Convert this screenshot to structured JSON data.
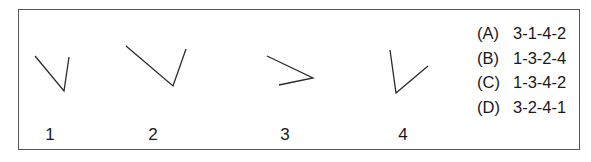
{
  "figures": [
    {
      "label": "1",
      "points": [
        [
          35,
          56
        ],
        [
          64,
          91
        ],
        [
          69,
          57
        ]
      ],
      "label_x": 50
    },
    {
      "label": "2",
      "points": [
        [
          126,
          46
        ],
        [
          173,
          86
        ],
        [
          186,
          49
        ]
      ],
      "label_x": 153
    },
    {
      "label": "3",
      "points": [
        [
          267,
          56
        ],
        [
          313,
          78
        ],
        [
          279,
          85
        ]
      ],
      "label_x": 285
    },
    {
      "label": "4",
      "points": [
        [
          390,
          50
        ],
        [
          396,
          93
        ],
        [
          428,
          66
        ]
      ],
      "label_x": 403
    }
  ],
  "options": [
    {
      "letter": "(A)",
      "sequence": "3-1-4-2"
    },
    {
      "letter": "(B)",
      "sequence": "1-3-2-4"
    },
    {
      "letter": "(C)",
      "sequence": "1-3-4-2"
    },
    {
      "letter": "(D)",
      "sequence": "3-2-4-1"
    }
  ],
  "colors": {
    "line": "#2a2a2a",
    "border": "#555555",
    "text": "#1a1a1a"
  }
}
